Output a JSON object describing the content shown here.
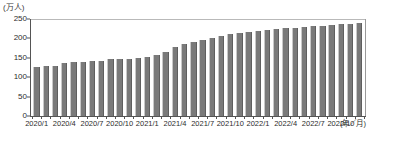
{
  "chart_data": {
    "type": "bar",
    "title": "",
    "subtitle": "",
    "xlabel": "(年／月)",
    "ylabel": "(万人)",
    "ylim": [
      0,
      250
    ],
    "yticks": [
      0,
      50,
      100,
      150,
      200,
      250
    ],
    "ytick_labels": [
      "0",
      "50",
      "100",
      "150",
      "200",
      "250"
    ],
    "grid": "top-only",
    "legend": "none",
    "bar_color": "#7a7a7a",
    "axis_color": "#555555",
    "gridline_color": "#b9b9b9",
    "categories": [
      "2020/1",
      "2020/2",
      "2020/3",
      "2020/4",
      "2020/5",
      "2020/6",
      "2020/7",
      "2020/8",
      "2020/9",
      "2020/10",
      "2020/11",
      "2020/12",
      "2021/1",
      "2021/2",
      "2021/3",
      "2021/4",
      "2021/5",
      "2021/6",
      "2021/7",
      "2021/8",
      "2021/9",
      "2021/10",
      "2021/11",
      "2021/12",
      "2022/1",
      "2022/2",
      "2022/3",
      "2022/4",
      "2022/5",
      "2022/6",
      "2022/7",
      "2022/8",
      "2022/9",
      "2022/10",
      "2022/11",
      "2022/12"
    ],
    "values": [
      126,
      128,
      130,
      136,
      139,
      139,
      141,
      142,
      146,
      148,
      147,
      150,
      153,
      158,
      166,
      178,
      186,
      192,
      197,
      202,
      207,
      211,
      214,
      217,
      219,
      221,
      223,
      226,
      228,
      230,
      231,
      233,
      234,
      236,
      238,
      240
    ],
    "xtick_labels": [
      {
        "category": "2020/1",
        "label": "2020/1"
      },
      {
        "category": "2020/4",
        "label": "2020/4"
      },
      {
        "category": "2020/7",
        "label": "2020/7"
      },
      {
        "category": "2020/10",
        "label": "2020/10"
      },
      {
        "category": "2021/1",
        "label": "2021/1"
      },
      {
        "category": "2021/4",
        "label": "2021/4"
      },
      {
        "category": "2021/7",
        "label": "2021/7"
      },
      {
        "category": "2021/10",
        "label": "2021/10"
      },
      {
        "category": "2022/1",
        "label": "2022/1"
      },
      {
        "category": "2022/4",
        "label": "2022/4"
      },
      {
        "category": "2022/7",
        "label": "2022/7"
      },
      {
        "category": "2022/10",
        "label": "2022/10"
      }
    ]
  }
}
